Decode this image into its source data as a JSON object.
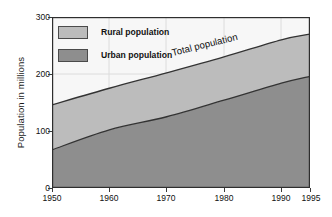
{
  "chart_data": {
    "type": "area",
    "stacked": true,
    "title": "",
    "subtitle": "",
    "xlabel": "",
    "ylabel": "Population in millions",
    "x": [
      1950,
      1960,
      1970,
      1980,
      1990,
      1995
    ],
    "xlim": [
      1950,
      1995
    ],
    "ylim": [
      0,
      300
    ],
    "xticks": [
      1950,
      1960,
      1970,
      1980,
      1990,
      1995
    ],
    "xticklabels": [
      "1950",
      "1960",
      "1970",
      "1980",
      "1990",
      "1995"
    ],
    "yticks": [
      0,
      100,
      200,
      300
    ],
    "yticklabels": [
      "0",
      "100",
      "200",
      "300"
    ],
    "grid": "vertical-and-horizontal-faint",
    "legend_position": "upper-left-inside",
    "series": [
      {
        "name": "Urban population",
        "values": [
          67,
          102,
          125,
          154,
          184,
          196
        ],
        "color": "#8e8e8e"
      },
      {
        "name": "Rural population",
        "values": [
          79,
          73,
          77,
          76,
          76,
          74
        ],
        "color": "#bcbcbc"
      }
    ],
    "totals": {
      "name": "Total population",
      "values": [
        146,
        175,
        202,
        230,
        260,
        270
      ]
    },
    "annotations": [
      {
        "text": "Total population",
        "kind": "curve-label",
        "series": "Total population"
      }
    ]
  },
  "legend": {
    "items": [
      {
        "label": "Rural population",
        "swatch_color": "#bcbcbc"
      },
      {
        "label": "Urban population",
        "swatch_color": "#8e8e8e"
      }
    ]
  },
  "axes": {
    "y_title": "Population in millions",
    "y_tick_labels": [
      "300",
      "200",
      "100",
      "0"
    ],
    "x_tick_labels": [
      "1950",
      "1960",
      "1970",
      "1980",
      "1990",
      "1995"
    ]
  },
  "annotation": {
    "total_population": "Total population"
  },
  "colors": {
    "rural_fill": "#bcbcbc",
    "urban_fill": "#8e8e8e",
    "plot_background": "#f7f7f7",
    "line": "#333333",
    "frame": "#2e2e2e",
    "grid": "#dcdcdc"
  }
}
